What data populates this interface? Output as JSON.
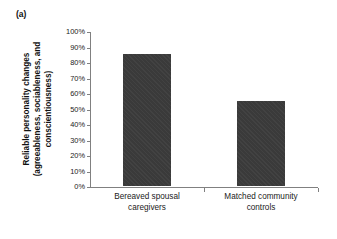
{
  "panel": {
    "label": "(a)"
  },
  "axis_title": {
    "line1": "Reliable personality changes",
    "line2": "(agreeableness, sociableness, and",
    "line3": "conscientiousness)"
  },
  "colors": {
    "bar_fill": "#3a3a3a",
    "axis_line": "#808080",
    "text": "#1a1a1a",
    "background": "#ffffff"
  },
  "chart_data": {
    "type": "bar",
    "title": "",
    "subtitle": "",
    "xlabel": "",
    "ylabel": "Reliable personality changes (agreeableness, sociableness, and conscientiousness)",
    "categories": [
      "Bereaved spousal caregivers",
      "Matched community controls"
    ],
    "category_lines": [
      [
        "Bereaved spousal",
        "caregivers"
      ],
      [
        "Matched community",
        "controls"
      ]
    ],
    "values": [
      85,
      55
    ],
    "value_labels": [
      "85%",
      "55%"
    ],
    "ylim": [
      0,
      100
    ],
    "ytick_values": [
      0,
      10,
      20,
      30,
      40,
      50,
      60,
      70,
      80,
      90,
      100
    ],
    "ytick_labels": [
      "0%",
      "10%",
      "20%",
      "30%",
      "40%",
      "50%",
      "60%",
      "70%",
      "80%",
      "90%",
      "100%"
    ],
    "grid": false,
    "legend": false,
    "legend_position": "none"
  }
}
